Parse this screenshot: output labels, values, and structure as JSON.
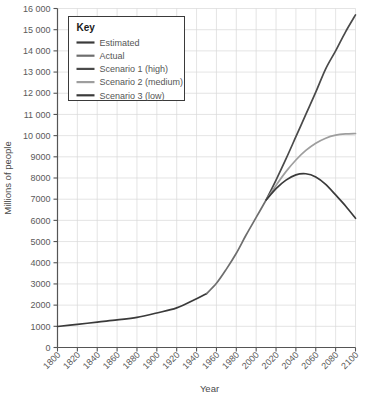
{
  "chart_data": {
    "type": "line",
    "title": "",
    "xlabel": "Year",
    "ylabel": "Millions of people",
    "xlim": [
      1800,
      2100
    ],
    "ylim": [
      0,
      16000
    ],
    "grid": true,
    "legend_position": "top-left",
    "legend_title": "Key",
    "xticks": [
      1800,
      1820,
      1840,
      1860,
      1880,
      1900,
      1920,
      1940,
      1960,
      1980,
      2000,
      2020,
      2040,
      2060,
      2080,
      2100
    ],
    "xtick_labels": [
      "1800",
      "1820",
      "1840",
      "1860",
      "1880",
      "1900",
      "1920",
      "1940",
      "1960",
      "1980",
      "2000",
      "2020",
      "2040",
      "2060",
      "2080",
      "2100"
    ],
    "yticks": [
      0,
      1000,
      2000,
      3000,
      4000,
      5000,
      6000,
      7000,
      8000,
      9000,
      10000,
      11000,
      12000,
      13000,
      14000,
      15000,
      16000
    ],
    "ytick_labels": [
      "0",
      "1000",
      "2000",
      "3000",
      "4000",
      "5000",
      "6000",
      "7000",
      "8000",
      "9000",
      "10 000",
      "11 000",
      "12 000",
      "13 000",
      "14 000",
      "15 000",
      "16 000"
    ],
    "series": [
      {
        "name": "Estimated",
        "color": "#3a3a3a",
        "x": [
          1800,
          1820,
          1840,
          1860,
          1880,
          1900,
          1920,
          1940,
          1950
        ],
        "values": [
          990,
          1090,
          1200,
          1300,
          1420,
          1630,
          1870,
          2300,
          2540
        ]
      },
      {
        "name": "Actual",
        "color": "#6e6e6e",
        "x": [
          1950,
          1960,
          1970,
          1980,
          1990,
          2000,
          2010
        ],
        "values": [
          2540,
          3030,
          3700,
          4450,
          5320,
          6140,
          6960
        ]
      },
      {
        "name": "Scenario 1 (high)",
        "color": "#4a4a4a",
        "x": [
          2010,
          2020,
          2030,
          2040,
          2050,
          2060,
          2070,
          2080,
          2090,
          2100
        ],
        "values": [
          6960,
          7900,
          8900,
          9950,
          11000,
          12050,
          13150,
          14000,
          14900,
          15700
        ]
      },
      {
        "name": "Scenario 2 (medium)",
        "color": "#9e9e9e",
        "x": [
          2010,
          2020,
          2030,
          2040,
          2050,
          2060,
          2070,
          2080,
          2090,
          2100
        ],
        "values": [
          6960,
          7650,
          8300,
          8850,
          9300,
          9640,
          9880,
          10020,
          10080,
          10100
        ]
      },
      {
        "name": "Scenario 3 (low)",
        "color": "#3a3a3a",
        "x": [
          2010,
          2020,
          2030,
          2040,
          2050,
          2060,
          2070,
          2080,
          2090,
          2100
        ],
        "values": [
          6960,
          7500,
          7900,
          8150,
          8200,
          8050,
          7700,
          7200,
          6680,
          6100
        ]
      }
    ]
  },
  "axes": {
    "x_title": "Year",
    "y_title": "Millions of people"
  },
  "legend": {
    "title": "Key",
    "entries": [
      {
        "label": "Estimated",
        "color": "#3a3a3a"
      },
      {
        "label": "Actual",
        "color": "#6e6e6e"
      },
      {
        "label": "Scenario 1 (high)",
        "color": "#4a4a4a"
      },
      {
        "label": "Scenario 2 (medium)",
        "color": "#9e9e9e"
      },
      {
        "label": "Scenario 3 (low)",
        "color": "#3a3a3a"
      }
    ]
  },
  "style": {
    "grid_color": "#d8d8d8",
    "axis_color": "#555555",
    "background": "#ffffff"
  }
}
